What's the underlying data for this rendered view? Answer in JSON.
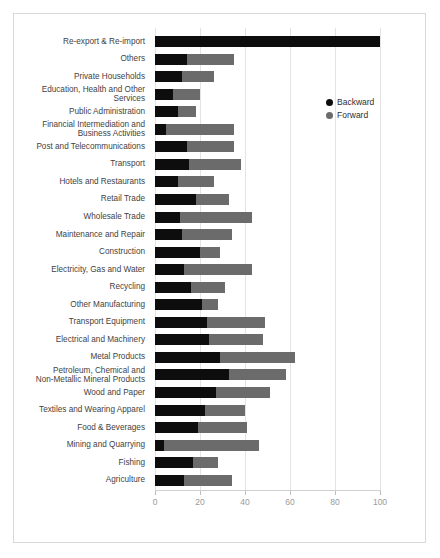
{
  "chart_data": {
    "type": "bar",
    "orientation": "horizontal",
    "stacked": true,
    "title": "",
    "subtitle": "",
    "xlabel": "",
    "ylabel": "",
    "xlim": [
      0,
      108
    ],
    "xticks": [
      0,
      20,
      40,
      60,
      80,
      100
    ],
    "xtick_labels": [
      "0",
      "20",
      "40",
      "60",
      "80",
      "100"
    ],
    "grid": "vertical",
    "legend_position": "upper-right-inside",
    "categories": [
      "Re-export & Re-import",
      "Others",
      "Private Households",
      "Education, Health and Other\nServices",
      "Public Administration",
      "Financial Intermediation and\nBusiness Activities",
      "Post and Telecommunications",
      "Transport",
      "Hotels and Restaurants",
      "Retail Trade",
      "Wholesale Trade",
      "Maintenance and Repair",
      "Construction",
      "Electricity, Gas and Water",
      "Recycling",
      "Other Manufacturing",
      "Transport Equipment",
      "Electrical and Machinery",
      "Metal Products",
      "Petroleum, Chemical and\nNon-Metallic Mineral Products",
      "Wood and Paper",
      "Textiles and Wearing Apparel",
      "Food & Beverages",
      "Mining and Quarrying",
      "Fishing",
      "Agriculture"
    ],
    "series": [
      {
        "name": "Backward",
        "color": "#0d0d0d",
        "values": [
          100,
          14,
          12,
          8,
          10,
          5,
          14,
          15,
          10,
          18,
          11,
          12,
          20,
          13,
          16,
          21,
          23,
          24,
          29,
          33,
          27,
          22,
          19,
          4,
          17,
          13
        ]
      },
      {
        "name": "Forward",
        "color": "#6b6b6b",
        "values": [
          0,
          21,
          14,
          12,
          8,
          30,
          21,
          23,
          16,
          15,
          32,
          22,
          9,
          30,
          15,
          7,
          26,
          24,
          33,
          25,
          24,
          18,
          22,
          42,
          11,
          21
        ]
      }
    ],
    "totals": [
      100,
      35,
      26,
      20,
      18,
      35,
      35,
      38,
      26,
      33,
      43,
      34,
      29,
      43,
      31,
      28,
      49,
      48,
      62,
      58,
      51,
      40,
      41,
      46,
      28,
      34
    ]
  },
  "legend": {
    "items": [
      {
        "label": "Backward",
        "color": "#0d0d0d"
      },
      {
        "label": "Forward",
        "color": "#6b6b6b"
      }
    ]
  }
}
